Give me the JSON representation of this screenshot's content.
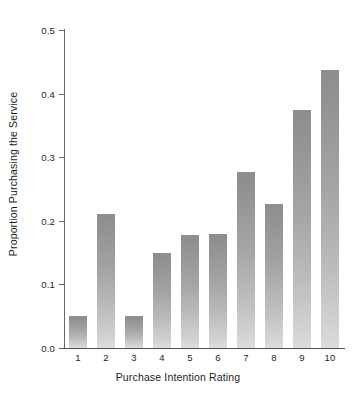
{
  "chart_data": {
    "type": "bar",
    "title": "",
    "xlabel": "Purchase Intention Rating",
    "ylabel": "Proportion Purchasing the Service",
    "categories": [
      "1",
      "2",
      "3",
      "4",
      "5",
      "6",
      "7",
      "8",
      "9",
      "10"
    ],
    "values": [
      0.05,
      0.21,
      0.05,
      0.149,
      0.178,
      0.179,
      0.276,
      0.226,
      0.375,
      0.437
    ],
    "ylim": [
      0.0,
      0.5
    ],
    "yticks": [
      0.0,
      0.1,
      0.2,
      0.3,
      0.4,
      0.5
    ],
    "ytick_labels": [
      "0.0",
      "0.1",
      "0.2",
      "0.3",
      "0.4",
      "0.5"
    ],
    "xlim": [
      0.5,
      10.5
    ],
    "grid": false,
    "legend": null,
    "series": [
      {
        "name": "Proportion Purchasing the Service",
        "values": [
          0.05,
          0.21,
          0.05,
          0.149,
          0.178,
          0.179,
          0.276,
          0.226,
          0.375,
          0.437
        ]
      }
    ],
    "bar_fill_top_color": "#8d8d8d",
    "bar_fill_bottom_color": "#dcdcdc",
    "axis_color": "#555555",
    "background_color": "#ffffff"
  }
}
